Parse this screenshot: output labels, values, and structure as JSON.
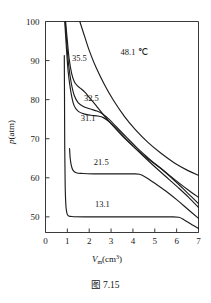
{
  "caption": "图 7.15",
  "chart_data": {
    "type": "line",
    "title": "",
    "xlabel": "Vm(cm3)",
    "ylabel": "p(atm)",
    "xlim": [
      0,
      7
    ],
    "ylim": [
      46,
      100
    ],
    "grid": false,
    "legend": "inline-curve-labels",
    "xticks": [
      "0",
      "1",
      "2",
      "3",
      "4",
      "5",
      "6",
      "7"
    ],
    "yticks": [
      "50",
      "60",
      "70",
      "80",
      "90",
      "100"
    ],
    "series": [
      {
        "name": "48.1",
        "label": "48.1 ℃",
        "label_x": 4.05,
        "label_y": 91.5,
        "points": [
          [
            1.57,
            100.0
          ],
          [
            1.8,
            96.0
          ],
          [
            2.0,
            92.6
          ],
          [
            2.3,
            88.4
          ],
          [
            2.7,
            83.8
          ],
          [
            3.1,
            79.9
          ],
          [
            3.6,
            75.8
          ],
          [
            4.1,
            72.4
          ],
          [
            4.7,
            69.0
          ],
          [
            5.3,
            66.2
          ],
          [
            5.9,
            63.8
          ],
          [
            6.5,
            61.9
          ],
          [
            7.0,
            60.6
          ]
        ]
      },
      {
        "name": "35.5",
        "label": "35.5",
        "label_x": 1.55,
        "label_y": 90.0,
        "points": [
          [
            0.92,
            100.0
          ],
          [
            1.0,
            95.0
          ],
          [
            1.08,
            90.5
          ],
          [
            1.2,
            86.6
          ],
          [
            1.32,
            84.6
          ],
          [
            1.45,
            83.6
          ],
          [
            1.6,
            82.9
          ],
          [
            1.8,
            81.9
          ],
          [
            2.0,
            80.6
          ],
          [
            2.3,
            78.6
          ],
          [
            2.7,
            75.8
          ],
          [
            3.1,
            73.2
          ],
          [
            3.6,
            70.2
          ],
          [
            4.1,
            67.6
          ],
          [
            4.7,
            64.8
          ],
          [
            5.3,
            62.3
          ],
          [
            5.9,
            59.6
          ],
          [
            6.5,
            57.0
          ],
          [
            7.0,
            55.0
          ]
        ]
      },
      {
        "name": "32.5",
        "label": "32.5",
        "label_x": 2.1,
        "label_y": 79.6,
        "points": [
          [
            0.9,
            100.0
          ],
          [
            0.98,
            94.0
          ],
          [
            1.06,
            88.8
          ],
          [
            1.18,
            84.2
          ],
          [
            1.32,
            81.0
          ],
          [
            1.5,
            79.2
          ],
          [
            1.75,
            78.2
          ],
          [
            2.05,
            77.6
          ],
          [
            2.35,
            77.1
          ],
          [
            2.6,
            76.4
          ],
          [
            2.9,
            75.0
          ],
          [
            3.25,
            73.0
          ],
          [
            3.7,
            70.4
          ],
          [
            4.2,
            67.6
          ],
          [
            4.8,
            64.6
          ],
          [
            5.4,
            61.8
          ],
          [
            6.0,
            58.8
          ],
          [
            6.5,
            56.1
          ],
          [
            7.0,
            53.4
          ]
        ]
      },
      {
        "name": "31.1",
        "label": "31.1",
        "label_x": 1.95,
        "label_y": 74.5,
        "points": [
          [
            0.88,
            100.0
          ],
          [
            0.96,
            93.0
          ],
          [
            1.04,
            87.0
          ],
          [
            1.16,
            82.0
          ],
          [
            1.3,
            78.6
          ],
          [
            1.5,
            77.0
          ],
          [
            1.8,
            76.3
          ],
          [
            2.1,
            76.0
          ],
          [
            2.4,
            75.8
          ],
          [
            2.65,
            75.4
          ],
          [
            2.95,
            74.2
          ],
          [
            3.3,
            72.2
          ],
          [
            3.75,
            69.6
          ],
          [
            4.25,
            66.8
          ],
          [
            4.85,
            63.6
          ],
          [
            5.45,
            60.6
          ],
          [
            6.05,
            57.6
          ],
          [
            6.55,
            55.0
          ],
          [
            7.0,
            52.4
          ]
        ]
      },
      {
        "name": "21.5",
        "label": "21.5",
        "label_x": 2.55,
        "label_y": 63.2,
        "points": [
          [
            1.1,
            67.5
          ],
          [
            1.13,
            65.0
          ],
          [
            1.18,
            63.2
          ],
          [
            1.26,
            61.9
          ],
          [
            1.4,
            61.3
          ],
          [
            1.7,
            61.1
          ],
          [
            2.2,
            61.0
          ],
          [
            2.8,
            61.0
          ],
          [
            3.4,
            61.0
          ],
          [
            4.0,
            61.0
          ],
          [
            4.3,
            60.9
          ],
          [
            4.6,
            60.1
          ],
          [
            5.0,
            58.6
          ],
          [
            5.5,
            56.6
          ],
          [
            6.0,
            54.4
          ],
          [
            6.5,
            52.0
          ],
          [
            7.0,
            49.6
          ]
        ]
      },
      {
        "name": "13.1",
        "label": "13.1",
        "label_x": 2.6,
        "label_y": 52.5,
        "points": [
          [
            0.86,
            91.3
          ],
          [
            0.87,
            80.0
          ],
          [
            0.88,
            68.0
          ],
          [
            0.9,
            58.0
          ],
          [
            0.94,
            52.4
          ],
          [
            1.02,
            50.4
          ],
          [
            1.2,
            50.1
          ],
          [
            1.8,
            50.0
          ],
          [
            2.6,
            50.0
          ],
          [
            3.4,
            50.0
          ],
          [
            4.2,
            50.0
          ],
          [
            5.0,
            50.0
          ],
          [
            5.7,
            50.0
          ],
          [
            6.1,
            49.9
          ],
          [
            6.35,
            49.2
          ],
          [
            6.7,
            48.0
          ],
          [
            7.0,
            47.0
          ]
        ]
      }
    ]
  }
}
